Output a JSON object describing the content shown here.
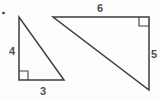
{
  "figure": {
    "type": "geometry-diagram",
    "stroke_color": "#3d3d3d",
    "label_color": "#4f4f4f",
    "bullet_color": "#333333",
    "small_triangle": {
      "vertical_leg_label": "4",
      "horizontal_leg_label": "3",
      "right_angle_at": "bottom-left"
    },
    "large_triangle": {
      "horizontal_leg_label": "6",
      "vertical_leg_label": "5",
      "right_angle_at": "top-right"
    }
  }
}
